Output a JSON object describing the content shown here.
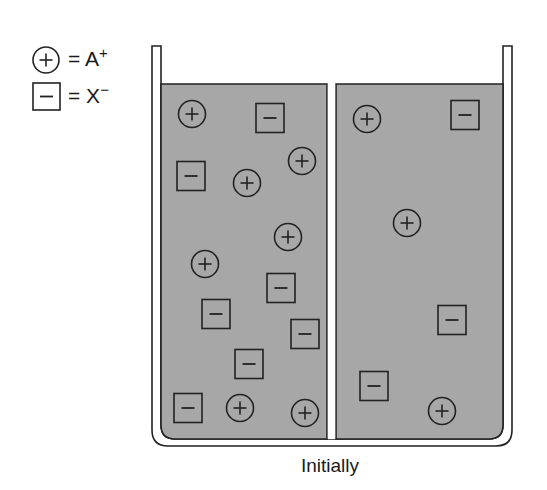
{
  "legend": {
    "cation": {
      "symbol": "+",
      "eq": "=",
      "label": "A",
      "charge": "+"
    },
    "anion": {
      "symbol": "−",
      "eq": "=",
      "label": "X",
      "charge": "−"
    }
  },
  "caption": "Initially",
  "colors": {
    "liquid": "#a7a7a7",
    "stroke": "#222222",
    "background": "#ffffff"
  },
  "beaker": {
    "compartments": [
      "left",
      "right"
    ],
    "partition": "semipermeable membrane"
  },
  "ions": {
    "left": {
      "cations": [
        [
          192,
          114
        ],
        [
          302,
          161
        ],
        [
          247,
          183
        ],
        [
          288,
          237
        ],
        [
          205,
          264
        ],
        [
          240,
          408
        ],
        [
          305,
          413
        ]
      ],
      "anions": [
        [
          270,
          118
        ],
        [
          191,
          176
        ],
        [
          281,
          288
        ],
        [
          216,
          314
        ],
        [
          305,
          334
        ],
        [
          249,
          364
        ],
        [
          188,
          408
        ]
      ]
    },
    "right": {
      "cations": [
        [
          367,
          119
        ],
        [
          407,
          223
        ],
        [
          442,
          411
        ]
      ],
      "anions": [
        [
          465,
          115
        ],
        [
          452,
          320
        ],
        [
          374,
          386
        ]
      ]
    }
  },
  "counts": {
    "left": {
      "A+": 7,
      "X-": 7
    },
    "right": {
      "A+": 3,
      "X-": 3
    }
  }
}
